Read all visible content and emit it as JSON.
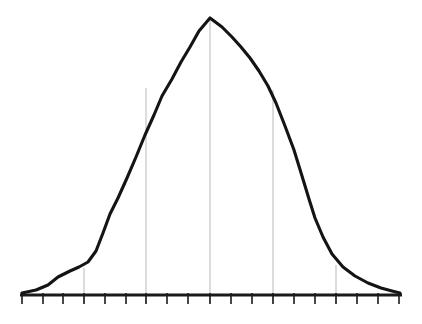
{
  "figure": {
    "background_color": "#ffffff",
    "width": 422,
    "height": 324,
    "title": "",
    "subtitle": "",
    "caption": ""
  },
  "chart_data": {
    "type": "line",
    "title": "",
    "subtitle": "",
    "xlabel": "",
    "ylabel": "",
    "grid": "vertical-only",
    "legend": "none",
    "style": "hand-drawn bell curve (normal distribution)",
    "xlim": [
      -3.75,
      3.75
    ],
    "ylim": [
      0,
      1.0
    ],
    "axis": {
      "color": "#1a1a1a",
      "line_width": 3,
      "tick_color": "#1a1a1a",
      "tick_length": 9,
      "tick_width": 1.6,
      "tick_count": 19,
      "tick_labels": [],
      "tick_values": [
        -3.6,
        -3.2,
        -2.8,
        -2.4,
        -2.0,
        -1.6,
        -1.2,
        -0.8,
        -0.4,
        0.0,
        0.4,
        0.8,
        1.2,
        1.6,
        2.0,
        2.4,
        2.8,
        3.2,
        3.6
      ],
      "tick_pixel_x": [
        22,
        43,
        63,
        84,
        105,
        126,
        146,
        167,
        188,
        210,
        231,
        252,
        273,
        294,
        315,
        336,
        357,
        378,
        399
      ],
      "axis_pixel_y": 295,
      "axis_pixel_x_start": 20,
      "axis_pixel_x_end": 402
    },
    "gridlines": {
      "color": "#b8b8b8",
      "line_width": 1,
      "values": [
        -2.0,
        -1.0,
        0.0,
        1.0,
        2.0
      ],
      "labels": [
        "-2σ",
        "-1σ",
        "μ",
        "+1σ",
        "+2σ"
      ],
      "pixel_x": [
        84,
        146,
        210,
        273,
        336
      ],
      "pixel_top_y": [
        268,
        88,
        18,
        90,
        265
      ],
      "pixel_bottom_y": 303
    },
    "curve": {
      "color": "#141414",
      "line_width": 3.1,
      "line_cap": "round",
      "line_join": "round",
      "peak_value": 1.0,
      "peak_pixel": [
        210,
        18
      ],
      "x": [
        -3.6,
        -3.3,
        -3.0,
        -2.75,
        -2.5,
        -2.3,
        -2.1,
        -2.0,
        -1.85,
        -1.7,
        -1.55,
        -1.4,
        -1.25,
        -1.1,
        -0.95,
        -0.8,
        -0.65,
        -0.5,
        -0.35,
        -0.18,
        0.0,
        0.18,
        0.35,
        0.5,
        0.65,
        0.8,
        0.95,
        1.1,
        1.25,
        1.4,
        1.55,
        1.7,
        1.85,
        2.0,
        2.15,
        2.35,
        2.55,
        2.8,
        3.05,
        3.3,
        3.6
      ],
      "y": [
        0.005,
        0.01,
        0.025,
        0.055,
        0.075,
        0.09,
        0.1,
        0.105,
        0.145,
        0.2,
        0.26,
        0.325,
        0.4,
        0.48,
        0.56,
        0.64,
        0.73,
        0.815,
        0.88,
        0.945,
        1.0,
        0.965,
        0.925,
        0.885,
        0.845,
        0.8,
        0.74,
        0.68,
        0.6,
        0.52,
        0.45,
        0.37,
        0.3,
        0.24,
        0.175,
        0.125,
        0.1,
        0.065,
        0.035,
        0.015,
        0.005
      ],
      "pixel_points": [
        [
          22,
          293
        ],
        [
          36,
          290
        ],
        [
          48,
          285
        ],
        [
          58,
          277
        ],
        [
          70,
          271
        ],
        [
          79,
          267
        ],
        [
          88,
          262
        ],
        [
          96,
          251
        ],
        [
          103,
          233
        ],
        [
          110,
          214
        ],
        [
          118,
          198
        ],
        [
          127,
          178
        ],
        [
          136,
          157
        ],
        [
          145,
          135
        ],
        [
          154,
          115
        ],
        [
          162,
          96
        ],
        [
          172,
          79
        ],
        [
          181,
          62
        ],
        [
          190,
          47
        ],
        [
          199,
          31
        ],
        [
          210,
          18
        ],
        [
          222,
          27
        ],
        [
          232,
          37
        ],
        [
          241,
          47
        ],
        [
          250,
          58
        ],
        [
          259,
          71
        ],
        [
          268,
          86
        ],
        [
          276,
          103
        ],
        [
          285,
          126
        ],
        [
          294,
          150
        ],
        [
          302,
          176
        ],
        [
          309,
          199
        ],
        [
          315,
          218
        ],
        [
          323,
          237
        ],
        [
          332,
          254
        ],
        [
          343,
          267
        ],
        [
          355,
          276
        ],
        [
          368,
          283
        ],
        [
          381,
          288
        ],
        [
          392,
          291
        ],
        [
          400,
          293
        ]
      ]
    }
  },
  "a11y": {
    "figure_role": "Bell curve chart",
    "description": "Symmetric bell-shaped normal distribution curve drawn in black over a horizontal tick-marked axis, with five faint vertical gridlines at the mean and at plus and minus one and two standard deviations."
  }
}
